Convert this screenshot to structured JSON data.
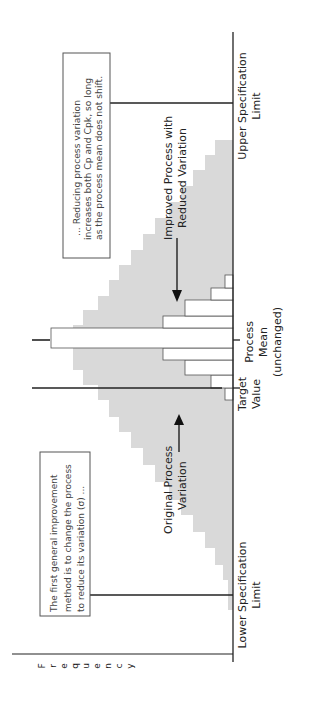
{
  "chart_data": {
    "type": "bar",
    "orientation": "rotated-90-ccw",
    "title": "",
    "xlabel": "",
    "ylabel": "Frequency",
    "grid": false,
    "legend": "none",
    "bins": [
      "b1",
      "b2",
      "b3",
      "b4",
      "b5",
      "b6",
      "b7",
      "b8",
      "b9",
      "b10",
      "b11",
      "b12",
      "b13",
      "b14",
      "b15",
      "b16",
      "b17",
      "b18",
      "b19",
      "b20",
      "b21",
      "b22",
      "b23",
      "b24",
      "b25",
      "b26",
      "b27",
      "b28",
      "b29",
      "b30"
    ],
    "series": [
      {
        "name": "Original Process Variation",
        "style": "gray-fill",
        "bin_edges_px": [
          610,
          580,
          565,
          548,
          532,
          515,
          500,
          482,
          465,
          448,
          432,
          417,
          400,
          385,
          370,
          355,
          340,
          325,
          310,
          296,
          280,
          265,
          250,
          234,
          218,
          202,
          186,
          170,
          155,
          140
        ],
        "heights_px": [
          5,
          10,
          18,
          28,
          40,
          52,
          64,
          78,
          90,
          102,
          114,
          124,
          135,
          150,
          160,
          160,
          160,
          150,
          135,
          124,
          114,
          102,
          90,
          78,
          64,
          52,
          40,
          28,
          18,
          10
        ]
      },
      {
        "name": "Improved Process with Reduced Variation",
        "style": "white-fill-outline",
        "bin_edges_px": [
          400,
          388,
          375,
          360,
          348,
          328,
          316,
          300,
          288,
          275,
          262
        ],
        "heights_px": [
          8,
          22,
          48,
          70,
          182,
          70,
          48,
          22,
          8,
          0
        ]
      }
    ],
    "reference_lines": [
      {
        "name": "Upper Specification Limit",
        "label": "Upper Specification Limit"
      },
      {
        "name": "Process Mean (unchanged)",
        "label": "Process Mean (unchanged)"
      },
      {
        "name": "Target Value",
        "label": "Target Value"
      },
      {
        "name": "Lower Specification Limit",
        "label": "Lower Specification Limit"
      }
    ],
    "annotations": [
      "The first general improvement method is to change the process to reduce its variation (σ) ...",
      "... Reducing process variation increases both Cp and Cpk, so long as the process mean does not shift."
    ]
  },
  "labels": {
    "frequency": "Frequency",
    "usl_line1": "Upper Specification",
    "usl_line2": "Limit",
    "lsl_line1": "Lower Specification",
    "lsl_line2": "Limit",
    "target_line1": "Target",
    "target_line2": "Value",
    "mean_line1": "Process",
    "mean_line2": "Mean",
    "mean_line3": "(unchanged)",
    "improved_line1": "Improved Process with",
    "improved_line2": "Reduced Variation",
    "original_line1": "Original Process",
    "original_line2": "Variation"
  },
  "notes": {
    "upper_box": [
      "... Reducing process variation",
      "increases both Cp and Cpk, so long",
      "as the process mean does not shift."
    ],
    "lower_box": [
      "The first general improvement",
      "method is to change the process",
      "to reduce its variation (σ) ..."
    ]
  },
  "colors": {
    "gray_fill": "#d9d9d9",
    "line": "#222222",
    "outline": "#555555"
  }
}
